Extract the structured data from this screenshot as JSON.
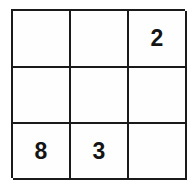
{
  "puzzle": {
    "type": "sliding-tile-grid",
    "rows": 3,
    "columns": 3,
    "grid_line_color": "#1a1a1a",
    "cell_background": "#fefefe",
    "digit_color": "#141414",
    "cells": [
      {
        "row": 1,
        "col": 1,
        "value": "",
        "empty": true
      },
      {
        "row": 1,
        "col": 2,
        "value": "",
        "empty": true
      },
      {
        "row": 1,
        "col": 3,
        "value": "2",
        "empty": false
      },
      {
        "row": 2,
        "col": 1,
        "value": "",
        "empty": true
      },
      {
        "row": 2,
        "col": 2,
        "value": "",
        "empty": true
      },
      {
        "row": 2,
        "col": 3,
        "value": "",
        "empty": true
      },
      {
        "row": 3,
        "col": 1,
        "value": "8",
        "empty": false
      },
      {
        "row": 3,
        "col": 2,
        "value": "3",
        "empty": false
      },
      {
        "row": 3,
        "col": 3,
        "value": "",
        "empty": true
      }
    ]
  }
}
